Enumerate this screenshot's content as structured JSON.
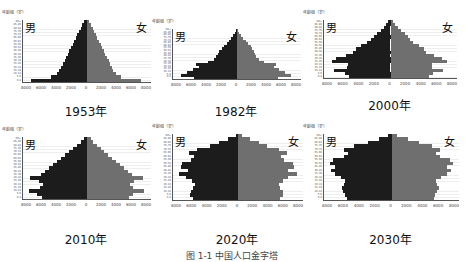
{
  "y_axis_title": "年龄组（岁）",
  "male_label": "男",
  "female_label": "女",
  "caption": "图 1-1 中国人口金字塔",
  "chart_data": [
    {
      "type": "bar",
      "subtype": "population_pyramid",
      "title": "1953年",
      "xlabel": "",
      "ylabel": "年龄组（岁）",
      "x_ticks": [
        "8000",
        "6000",
        "4000",
        "2000",
        "0",
        "2000",
        "4000",
        "6000",
        "8000"
      ],
      "xlim": [
        -8000,
        8000
      ],
      "categories": [
        "0-4",
        "5-9",
        "10-14",
        "15-19",
        "20-24",
        "25-29",
        "30-34",
        "35-39",
        "40-44",
        "45-49",
        "50-54",
        "55-59",
        "60-64",
        "65-69",
        "70-74",
        "75-79",
        "80-84",
        "85-89",
        "90+"
      ],
      "series": [
        {
          "name": "男",
          "values": [
            7000,
            4500,
            3800,
            3500,
            3200,
            3000,
            2800,
            2600,
            2400,
            2200,
            2000,
            1800,
            1600,
            1400,
            1200,
            1000,
            800,
            600,
            400
          ]
        },
        {
          "name": "女",
          "values": [
            6800,
            4200,
            3600,
            3300,
            3100,
            2900,
            2700,
            2500,
            2300,
            2100,
            1900,
            1700,
            1500,
            1300,
            1100,
            900,
            700,
            500,
            300
          ]
        }
      ],
      "legend": [
        "男",
        "女"
      ],
      "grid": true
    },
    {
      "type": "bar",
      "subtype": "population_pyramid",
      "title": "1982年",
      "xlabel": "",
      "ylabel": "年龄组（岁）",
      "x_ticks": [
        "8000",
        "6000",
        "4000",
        "2000",
        "0",
        "2000",
        "4000",
        "6000",
        "8000"
      ],
      "xlim": [
        -8000,
        8000
      ],
      "categories": [
        "0-4",
        "5-9",
        "10-14",
        "15-19",
        "20-24",
        "25-29",
        "30-34",
        "35-39",
        "40-44",
        "45-49",
        "50-54",
        "55-59",
        "60-64",
        "65-69",
        "70-74",
        "75-79",
        "80-84",
        "85-89",
        "90+"
      ],
      "series": [
        {
          "name": "男",
          "values": [
            5400,
            7000,
            6300,
            5500,
            4800,
            5100,
            3600,
            2900,
            2600,
            2400,
            2200,
            1900,
            1600,
            1300,
            1000,
            700,
            450,
            250,
            100
          ]
        },
        {
          "name": "女",
          "values": [
            5100,
            6700,
            6000,
            5200,
            4600,
            4900,
            3400,
            2700,
            2400,
            2200,
            2100,
            1900,
            1700,
            1400,
            1100,
            800,
            550,
            300,
            150
          ]
        }
      ],
      "legend": [
        "男",
        "女"
      ],
      "grid": true
    },
    {
      "type": "bar",
      "subtype": "population_pyramid",
      "title": "2000年",
      "xlabel": "",
      "ylabel": "年龄组（岁）",
      "x_ticks": [
        "8000",
        "6000",
        "4000",
        "2000",
        "0",
        "2000",
        "4000",
        "6000",
        "8000"
      ],
      "xlim": [
        -8000,
        8000
      ],
      "categories": [
        "0-4",
        "5-9",
        "10-14",
        "15-19",
        "20-24",
        "25-29",
        "30-34",
        "35-39",
        "40-44",
        "45-49",
        "50-54",
        "55-59",
        "60-64",
        "65-69",
        "70-74",
        "75-79",
        "80-84",
        "85-89",
        "90+"
      ],
      "series": [
        {
          "name": "男",
          "values": [
            5000,
            5500,
            6800,
            5200,
            5100,
            7000,
            6500,
            5400,
            4500,
            4200,
            3600,
            2800,
            2400,
            2000,
            1600,
            1200,
            800,
            500,
            250
          ]
        },
        {
          "name": "女",
          "values": [
            4600,
            5100,
            6300,
            5000,
            5000,
            6800,
            6200,
            5200,
            4300,
            4000,
            3400,
            2700,
            2400,
            2100,
            1700,
            1300,
            900,
            600,
            350
          ]
        }
      ],
      "legend": [
        "男",
        "女"
      ],
      "grid": true
    },
    {
      "type": "bar",
      "subtype": "population_pyramid",
      "title": "2010年",
      "xlabel": "",
      "ylabel": "年龄组（岁）",
      "x_ticks": [
        "8000",
        "6000",
        "4000",
        "2000",
        "0",
        "2000",
        "4000",
        "6000",
        "8000"
      ],
      "xlim": [
        -8000,
        8000
      ],
      "categories": [
        "0-4",
        "5-9",
        "10-14",
        "15-19",
        "20-24",
        "25-29",
        "30-34",
        "35-39",
        "40-44",
        "45-49",
        "50-54",
        "55-59",
        "60-64",
        "65-69",
        "70-74",
        "75-79",
        "80-84",
        "85-89",
        "90+"
      ],
      "series": [
        {
          "name": "男",
          "values": [
            5600,
            6200,
            7300,
            5900,
            5500,
            6000,
            7100,
            5700,
            5200,
            4700,
            4200,
            3700,
            3200,
            2700,
            2200,
            1700,
            1200,
            700,
            350
          ]
        },
        {
          "name": "女",
          "values": [
            5300,
            5800,
            7100,
            5700,
            5400,
            5900,
            7000,
            5600,
            5100,
            4600,
            4100,
            3600,
            3100,
            2600,
            2100,
            1700,
            1200,
            800,
            450
          ]
        }
      ],
      "legend": [
        "男",
        "女"
      ],
      "grid": true
    },
    {
      "type": "bar",
      "subtype": "population_pyramid",
      "title": "2020年",
      "xlabel": "",
      "ylabel": "年龄组（岁）",
      "x_ticks": [
        "8000",
        "6000",
        "4000",
        "2000",
        "0",
        "2000",
        "4000",
        "6000",
        "8000"
      ],
      "xlim": [
        -8000,
        8000
      ],
      "categories": [
        "0-4",
        "5-9",
        "10-14",
        "15-19",
        "20-24",
        "25-29",
        "30-34",
        "35-39",
        "40-44",
        "45-49",
        "50-54",
        "55-59",
        "60-64",
        "65-69",
        "70-74",
        "75-79",
        "80-84",
        "85-89",
        "90+"
      ],
      "series": [
        {
          "name": "男",
          "values": [
            5600,
            5900,
            5800,
            5500,
            5300,
            5700,
            6400,
            7300,
            6200,
            7000,
            6900,
            5800,
            5400,
            6000,
            5000,
            3400,
            2300,
            1200,
            300
          ]
        },
        {
          "name": "女",
          "values": [
            5200,
            5500,
            5500,
            5200,
            5100,
            5500,
            6200,
            7200,
            6100,
            6900,
            6800,
            5700,
            5300,
            6000,
            5100,
            3600,
            2600,
            1500,
            500
          ]
        }
      ],
      "legend": [
        "男",
        "女"
      ],
      "grid": true
    },
    {
      "type": "bar",
      "subtype": "population_pyramid",
      "title": "2030年",
      "xlabel": "",
      "ylabel": "年龄组（岁）",
      "x_ticks": [
        "8000",
        "6000",
        "4000",
        "2000",
        "0",
        "2000",
        "4000",
        "6000",
        "8000"
      ],
      "xlim": [
        -8000,
        8000
      ],
      "categories": [
        "0-4",
        "5-9",
        "10-14",
        "15-19",
        "20-24",
        "25-29",
        "30-34",
        "35-39",
        "40-44",
        "45-49",
        "50-54",
        "55-59",
        "60-64",
        "65-69",
        "70-74",
        "75-79",
        "80-84",
        "85-89",
        "90+"
      ],
      "series": [
        {
          "name": "男",
          "values": [
            5300,
            5500,
            5700,
            5900,
            5600,
            5500,
            6000,
            6700,
            7200,
            6700,
            7300,
            6900,
            5600,
            5200,
            5600,
            4500,
            2800,
            1500,
            400
          ]
        },
        {
          "name": "女",
          "values": [
            5000,
            5200,
            5400,
            5600,
            5400,
            5300,
            5900,
            6600,
            7100,
            6600,
            7300,
            6900,
            5700,
            5300,
            5800,
            4800,
            3200,
            1900,
            700
          ]
        }
      ],
      "legend": [
        "男",
        "女"
      ],
      "grid": true
    }
  ]
}
